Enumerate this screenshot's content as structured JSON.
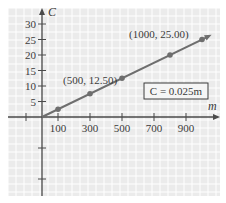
{
  "chart_data": {
    "type": "line",
    "title": "",
    "xlabel": "m",
    "ylabel": "C",
    "equation_label": "C = 0.025m",
    "x_ticks": [
      100,
      300,
      500,
      700,
      900
    ],
    "y_ticks": [
      5,
      10,
      15,
      20,
      25,
      30
    ],
    "x_tick_labels": [
      "100",
      "300",
      "500",
      "700",
      "900"
    ],
    "y_tick_labels": [
      "5",
      "10",
      "15",
      "20",
      "25",
      "30"
    ],
    "xlim": [
      -200,
      1100
    ],
    "ylim": [
      -25,
      32
    ],
    "grid": true,
    "series": [
      {
        "name": "C = 0.025m",
        "x": [
          0,
          100,
          300,
          500,
          800,
          1000
        ],
        "y": [
          0,
          2.5,
          7.5,
          12.5,
          20,
          25
        ]
      }
    ],
    "annotations": [
      {
        "text": "(500, 12.50)",
        "x": 500,
        "y": 12.5
      },
      {
        "text": "(1000, 25.00)",
        "x": 1000,
        "y": 25
      }
    ]
  },
  "style": {
    "background": "#ebebeb",
    "grid_color": "#ffffff",
    "axis_color": "#4a4a4a",
    "line_color": "#6e6e6e",
    "point_color": "#6e6e6e"
  }
}
